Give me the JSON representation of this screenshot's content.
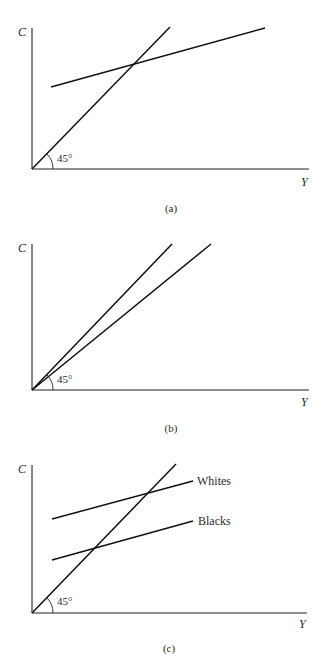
{
  "figure": {
    "panels": [
      {
        "id": "a",
        "caption": "(a)",
        "y_label": "C",
        "x_label": "Y",
        "angle_label": "45°",
        "lines": [
          {
            "name": "45-degree line",
            "label": ""
          },
          {
            "name": "consumption function",
            "label": ""
          }
        ]
      },
      {
        "id": "b",
        "caption": "(b)",
        "y_label": "C",
        "x_label": "Y",
        "angle_label": "45°",
        "lines": [
          {
            "name": "45-degree line",
            "label": ""
          },
          {
            "name": "proportional consumption line",
            "label": ""
          }
        ]
      },
      {
        "id": "c",
        "caption": "(c)",
        "y_label": "C",
        "x_label": "Y",
        "angle_label": "45°",
        "lines": [
          {
            "name": "45-degree line",
            "label": ""
          },
          {
            "name": "whites consumption function",
            "label": "Whites"
          },
          {
            "name": "blacks consumption function",
            "label": "Blacks"
          }
        ]
      }
    ]
  }
}
